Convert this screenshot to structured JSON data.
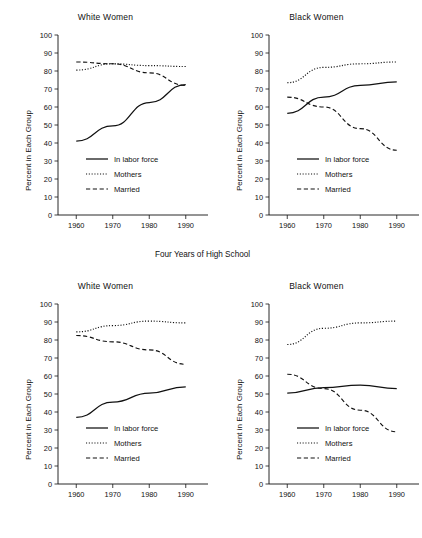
{
  "figure": {
    "caption": "Four Years of High School",
    "ylabel": "Percent in Each Group",
    "yticks": [
      "0",
      "10",
      "20",
      "30",
      "40",
      "50",
      "60",
      "70",
      "80",
      "90",
      "100"
    ],
    "xticks": [
      "1960",
      "1970",
      "1980",
      "1990"
    ],
    "legend": {
      "in_labor_force": "In labor force",
      "mothers": "Mothers",
      "married": "Married"
    },
    "colors": {
      "ink": "#111111",
      "background": "#ffffff"
    }
  },
  "chart_data": [
    {
      "id": "top-left",
      "type": "line",
      "title": "White Women",
      "xlabel": "",
      "ylabel": "Percent in Each Group",
      "x": [
        1960,
        1970,
        1980,
        1990
      ],
      "xlim": [
        1955,
        1995
      ],
      "ylim": [
        0,
        100
      ],
      "grid": false,
      "legend_position": "lower-center",
      "series": [
        {
          "name": "In labor force",
          "style": "solid",
          "values": [
            41,
            49.5,
            62.5,
            72.5
          ]
        },
        {
          "name": "Mothers",
          "style": "dotted",
          "values": [
            80.5,
            84,
            83,
            82.5
          ]
        },
        {
          "name": "Married",
          "style": "dashed",
          "values": [
            85,
            84,
            79,
            72
          ]
        }
      ]
    },
    {
      "id": "top-right",
      "type": "line",
      "title": "Black Women",
      "xlabel": "",
      "ylabel": "Percent in Each Group",
      "x": [
        1960,
        1970,
        1980,
        1990
      ],
      "xlim": [
        1955,
        1995
      ],
      "ylim": [
        0,
        100
      ],
      "grid": false,
      "legend_position": "lower-center",
      "series": [
        {
          "name": "In labor force",
          "style": "solid",
          "values": [
            56.5,
            65.5,
            72,
            74
          ]
        },
        {
          "name": "Mothers",
          "style": "dotted",
          "values": [
            73.5,
            82,
            84,
            85
          ]
        },
        {
          "name": "Married",
          "style": "dashed",
          "values": [
            65.5,
            60,
            48,
            36
          ]
        }
      ]
    },
    {
      "id": "bottom-left",
      "type": "line",
      "title": "White Women",
      "xlabel": "",
      "ylabel": "Percent in Each Group",
      "x": [
        1960,
        1970,
        1980,
        1990
      ],
      "xlim": [
        1955,
        1995
      ],
      "ylim": [
        0,
        100
      ],
      "grid": false,
      "legend_position": "lower-center",
      "series": [
        {
          "name": "In labor force",
          "style": "solid",
          "values": [
            37,
            45.5,
            50.5,
            54
          ]
        },
        {
          "name": "Mothers",
          "style": "dotted",
          "values": [
            84.5,
            88,
            90.5,
            89.5
          ]
        },
        {
          "name": "Married",
          "style": "dashed",
          "values": [
            82.5,
            79,
            74.5,
            66.5
          ]
        }
      ]
    },
    {
      "id": "bottom-right",
      "type": "line",
      "title": "Black Women",
      "xlabel": "",
      "ylabel": "Percent in Each Group",
      "x": [
        1960,
        1970,
        1980,
        1990
      ],
      "xlim": [
        1955,
        1995
      ],
      "ylim": [
        0,
        100
      ],
      "grid": false,
      "legend_position": "lower-center",
      "series": [
        {
          "name": "In labor force",
          "style": "solid",
          "values": [
            50.5,
            53.5,
            55,
            53
          ]
        },
        {
          "name": "Mothers",
          "style": "dotted",
          "values": [
            77.5,
            86.5,
            89.5,
            90.5
          ]
        },
        {
          "name": "Married",
          "style": "dashed",
          "values": [
            61,
            53,
            41,
            29
          ]
        }
      ]
    }
  ]
}
